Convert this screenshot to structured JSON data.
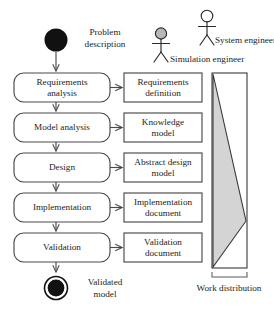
{
  "diagram": {
    "type": "uml-activity-diagram",
    "colors": {
      "stroke": "#4a4a4a",
      "text": "#1d1d1d",
      "initial_node_fill": "#111111",
      "final_node_fill": "#111111",
      "triangle_fill": "#d4d4d4",
      "simulation_engineer_head_fill": "#b8b8b8",
      "system_engineer_head_fill": "#ffffff",
      "background": "#ffffff"
    },
    "initial_node": {
      "name": "initial-node",
      "label_line1": "Problem",
      "label_line2": "description"
    },
    "final_node": {
      "name": "final-node",
      "label_line1": "Validated",
      "label_line2": "model"
    },
    "actors": [
      {
        "id": "simulation-engineer",
        "label": "Simulation engineer",
        "head_filled": true
      },
      {
        "id": "system-engineer",
        "label": "System engineer",
        "head_filled": false
      }
    ],
    "activities": [
      {
        "id": "requirements-analysis",
        "line1": "Requirements",
        "line2": "analysis"
      },
      {
        "id": "model-analysis",
        "line1": "Model analysis",
        "line2": ""
      },
      {
        "id": "design",
        "line1": "Design",
        "line2": ""
      },
      {
        "id": "implementation",
        "line1": "Implementation",
        "line2": ""
      },
      {
        "id": "validation",
        "line1": "Validation",
        "line2": ""
      }
    ],
    "artifacts": [
      {
        "id": "requirements-definition",
        "line1": "Requirements",
        "line2": "definition"
      },
      {
        "id": "knowledge-model",
        "line1": "Knowledge",
        "line2": "model"
      },
      {
        "id": "abstract-design-model",
        "line1": "Abstract design",
        "line2": "model"
      },
      {
        "id": "implementation-document",
        "line1": "Implementation",
        "line2": "document"
      },
      {
        "id": "validation-document",
        "line1": "Validation",
        "line2": "document"
      }
    ],
    "work_distribution": {
      "id": "work-distribution",
      "label": "Work distribution"
    }
  }
}
